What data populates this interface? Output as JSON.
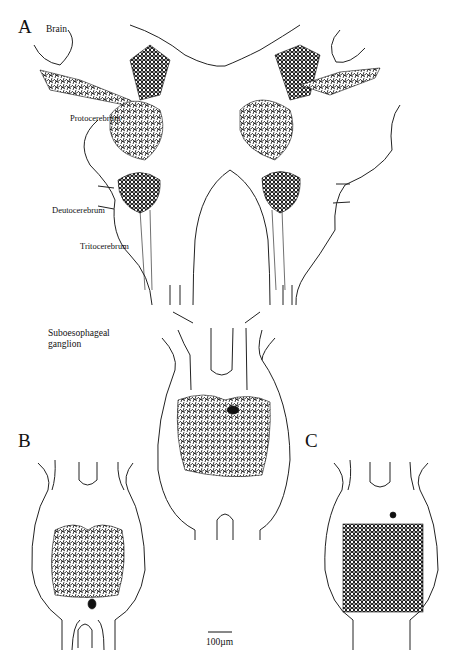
{
  "figure": {
    "panels": [
      {
        "id": "A",
        "label": "A",
        "title": "Brain"
      },
      {
        "id": "B",
        "label": "B"
      },
      {
        "id": "C",
        "label": "C"
      }
    ],
    "region_labels": {
      "protocerebrum": "Protocerebrum",
      "deutocerebrum": "Deutocerebrum",
      "tritocerebrum": "Tritocerebrum",
      "suboesophageal": "Suboesophageal\nganglion"
    },
    "scale_bar": {
      "label": "100µm",
      "length_px": 24
    },
    "colors": {
      "line": "#111111",
      "background": "#ffffff"
    }
  }
}
